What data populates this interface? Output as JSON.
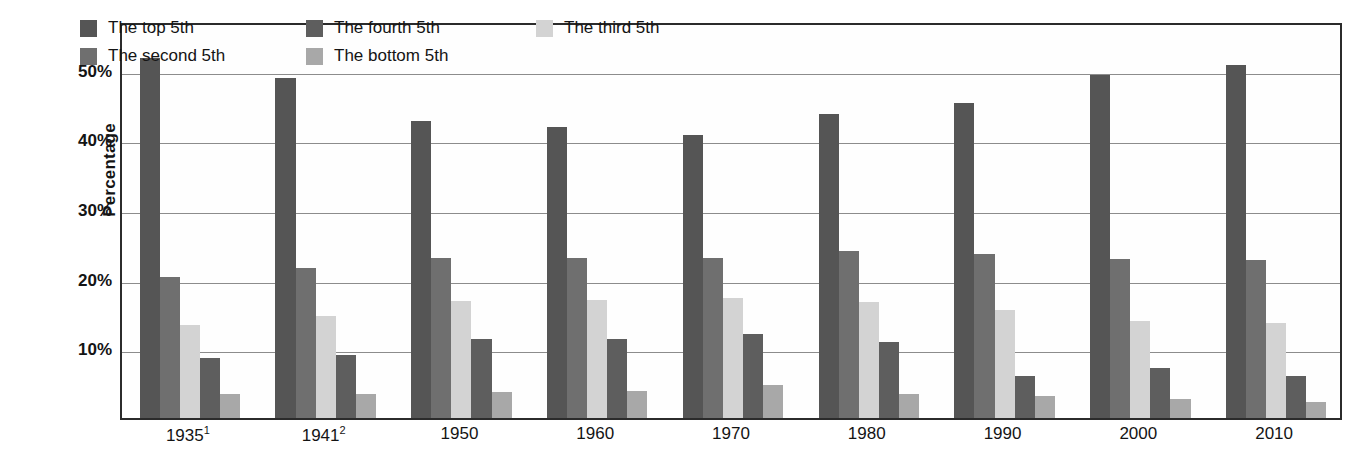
{
  "chart_data": {
    "type": "bar",
    "title": "",
    "xlabel": "",
    "ylabel": "Percentage",
    "ylim": [
      0,
      57
    ],
    "grid": true,
    "legend_position": "top-left-inside",
    "categories": [
      "1935¹",
      "1941²",
      "1950",
      "1960",
      "1970",
      "1980",
      "1990",
      "2000",
      "2010"
    ],
    "category_plain": [
      "1935",
      "1941",
      "1950",
      "1960",
      "1970",
      "1980",
      "1990",
      "2000",
      "2010"
    ],
    "footnotes": [
      "1",
      "2"
    ],
    "tick_labels_y": [
      "10%",
      "20%",
      "30%",
      "40%",
      "50%"
    ],
    "tick_values_y": [
      10,
      20,
      30,
      40,
      50
    ],
    "series": [
      {
        "name": "The top 5th",
        "color": "#555555",
        "values": [
          51.7,
          48.8,
          42.7,
          41.8,
          40.7,
          43.7,
          45.2,
          49.3,
          50.7
        ]
      },
      {
        "name": "The second 5th",
        "color": "#6f6f6f",
        "values": [
          20.3,
          21.6,
          23.0,
          23.0,
          23.0,
          24.0,
          23.6,
          22.8,
          22.7
        ]
      },
      {
        "name": "The third 5th",
        "color": "#d3d3d3",
        "values": [
          13.4,
          14.6,
          16.8,
          17.0,
          17.2,
          16.7,
          15.5,
          14.0,
          13.7
        ]
      },
      {
        "name": "The fourth 5th",
        "color": "#5e5e5e",
        "values": [
          8.6,
          9.0,
          11.3,
          11.4,
          12.0,
          10.9,
          6.0,
          7.2,
          6.0
        ]
      },
      {
        "name": "The bottom 5th",
        "color": "#a8a8a8",
        "values": [
          3.4,
          3.4,
          3.7,
          3.9,
          4.8,
          3.4,
          3.1,
          2.7,
          2.3
        ]
      }
    ],
    "legend_order": [
      "The top 5th",
      "The fourth 5th",
      "The third 5th",
      "The second 5th",
      "The bottom 5th"
    ]
  },
  "axes": {
    "y_title": "Percentage"
  },
  "colors": {
    "frame": "#2b2b2b",
    "gridline": "#8c8c8c",
    "background": "#ffffff",
    "text": "#141414"
  }
}
